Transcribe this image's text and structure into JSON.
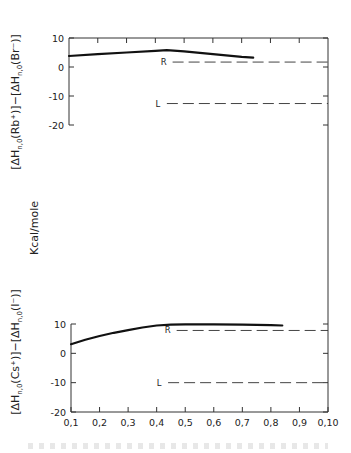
{
  "chart_data": [
    {
      "type": "line",
      "panel": "top",
      "ylabel_parts": [
        "[ΔH",
        "n,0",
        "(Rb⁺)]−[ΔH",
        "n,0",
        "(Br⁻)]"
      ],
      "ylabel": "[ΔH_n,0(Rb⁺)]−[ΔH_n,0(Br⁻)]",
      "ylim": [
        -20,
        10
      ],
      "yticks": [
        10,
        0,
        -10,
        -20
      ],
      "ytick_labels": [
        "10",
        "0",
        "-10",
        "-20"
      ],
      "xlim": [
        1,
        10
      ],
      "grid": false,
      "series": [
        {
          "name": "curve",
          "style": "solid",
          "x": [
            1,
            2,
            3,
            4,
            4.4,
            5,
            6,
            7,
            7.4
          ],
          "y": [
            3.8,
            4.4,
            5.0,
            5.6,
            5.8,
            5.4,
            4.4,
            3.5,
            3.2
          ]
        }
      ],
      "reference_lines": [
        {
          "label": "R",
          "y": 1.7,
          "x_start": 4.6,
          "x_end": 10
        },
        {
          "label": "L",
          "y": -12.6,
          "x_start": 4.4,
          "x_end": 10
        }
      ]
    },
    {
      "type": "line",
      "panel": "bottom",
      "ylabel_parts": [
        "[ΔH",
        "n,0",
        "(Cs⁺)]−[ΔH",
        "n,0",
        "(I⁻)]"
      ],
      "ylabel": "[ΔH_n,0(Cs⁺)]−[ΔH_n,0(I⁻)]",
      "ylim": [
        -20,
        10
      ],
      "yticks": [
        10,
        0,
        -10,
        -20
      ],
      "ytick_labels": [
        "10",
        "0",
        "-10",
        "-20"
      ],
      "xlim": [
        1,
        10
      ],
      "xticks": [
        1,
        2,
        3,
        4,
        5,
        6,
        7,
        8,
        9,
        10
      ],
      "xtick_labels": [
        "0,1",
        "0,2",
        "0,3",
        "0,4",
        "0,5",
        "0,6",
        "0,7",
        "0,8",
        "0,9",
        "0,10"
      ],
      "grid": false,
      "series": [
        {
          "name": "curve",
          "style": "solid",
          "x": [
            1,
            1.5,
            2,
            2.5,
            3,
            3.5,
            4,
            4.5,
            5,
            6,
            7,
            8,
            8.4
          ],
          "y": [
            3.1,
            4.6,
            5.9,
            7.0,
            7.9,
            8.8,
            9.5,
            9.8,
            9.9,
            9.9,
            9.8,
            9.6,
            9.5
          ]
        }
      ],
      "reference_lines": [
        {
          "label": "R",
          "y": 7.8,
          "x_start": 4.7,
          "x_end": 10
        },
        {
          "label": "L",
          "y": -10,
          "x_start": 4.4,
          "x_end": 10
        }
      ]
    }
  ],
  "shared": {
    "units_label": "Kcal/mole"
  }
}
